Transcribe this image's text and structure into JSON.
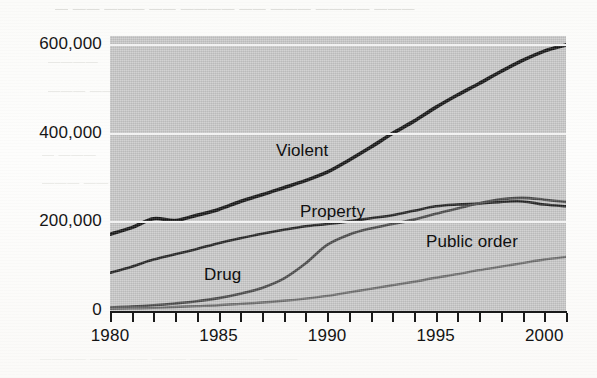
{
  "page": {
    "bleed_text_top": "— —— ——— —— ———— —— ——— ———— ———",
    "bleed_text_a": "————",
    "bleed_text_b": "——— ——",
    "bleed_text_c": "—  ———",
    "bleed_text_d": "———  ——",
    "bleed_text_bottom": "———— ————— ——— —————— ———",
    "bleed_text_right": "——————"
  },
  "chart_data": {
    "type": "line",
    "title": "",
    "subtitle": "",
    "xlabel": "",
    "ylabel": "",
    "xlim": [
      1980,
      2001
    ],
    "ylim": [
      0,
      620000
    ],
    "grid": true,
    "grid_color": "#f2f2f2",
    "plot_background": "#c9c9c9",
    "legend_position": "inline-annotations",
    "y_ticks": [
      0,
      200000,
      400000,
      600000
    ],
    "y_tick_labels": [
      "0",
      "200,000",
      "400,000",
      "600,000"
    ],
    "x_ticks": [
      1980,
      1981,
      1982,
      1983,
      1984,
      1985,
      1986,
      1987,
      1988,
      1989,
      1990,
      1991,
      1992,
      1993,
      1994,
      1995,
      1996,
      1997,
      1998,
      1999,
      2000,
      2001
    ],
    "x_tick_labels_shown": [
      "1980",
      "1985",
      "1990",
      "1995",
      "2000"
    ],
    "x_labeled_ticks": [
      1980,
      1985,
      1990,
      1995,
      2000
    ],
    "x": [
      1980,
      1981,
      1982,
      1983,
      1984,
      1985,
      1986,
      1987,
      1988,
      1989,
      1990,
      1991,
      1992,
      1993,
      1994,
      1995,
      1996,
      1997,
      1998,
      1999,
      2000,
      2001
    ],
    "series": [
      {
        "name": "Violent",
        "label": "Violent",
        "color": "#141414",
        "width": 3.6,
        "values": [
          173000,
          188000,
          208000,
          204000,
          216000,
          229000,
          247000,
          262000,
          278000,
          294000,
          313000,
          340000,
          369000,
          400000,
          428000,
          459000,
          487000,
          513000,
          540000,
          565000,
          586000,
          600000
        ]
      },
      {
        "name": "Property",
        "label": "Property",
        "color": "#232323",
        "width": 2.6,
        "values": [
          86000,
          100000,
          116000,
          128000,
          140000,
          153000,
          164000,
          174000,
          183000,
          191000,
          196000,
          202000,
          209000,
          216000,
          226000,
          236000,
          240000,
          242000,
          246000,
          247000,
          240000,
          236000
        ]
      },
      {
        "name": "Drug",
        "label": "Drug",
        "color": "#4a4a4a",
        "width": 2.6,
        "values": [
          8000,
          10000,
          13000,
          17000,
          22000,
          29000,
          39000,
          52000,
          73000,
          107000,
          149000,
          172000,
          186000,
          196000,
          206000,
          219000,
          231000,
          243000,
          252000,
          255000,
          251000,
          246000
        ]
      },
      {
        "name": "Public order",
        "label": "Public order",
        "color": "#6e6e6e",
        "width": 2.4,
        "values": [
          5000,
          6000,
          7000,
          9000,
          11000,
          13000,
          16000,
          19000,
          23000,
          28000,
          34000,
          42000,
          50000,
          58000,
          66000,
          75000,
          83000,
          92000,
          100000,
          108000,
          116000,
          122000
        ]
      }
    ],
    "annotations": [
      {
        "text": "Violent",
        "x_px": 276,
        "y_px": 141
      },
      {
        "text": "Property",
        "x_px": 300,
        "y_px": 202
      },
      {
        "text": "Drug",
        "x_px": 204,
        "y_px": 265
      },
      {
        "text": "Public order",
        "x_px": 426,
        "y_px": 232
      }
    ]
  }
}
